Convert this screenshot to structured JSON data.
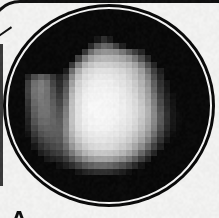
{
  "figure": {
    "panel_label": "A"
  },
  "colors": {
    "background": "#f5f5f4",
    "frame_line": "#0e0e0e",
    "disk_fill": "#070707",
    "ring": "#f7f7f7",
    "label": "#0d0d0d"
  },
  "bitmap": {
    "cols": 27,
    "rows": 23,
    "pixels": [
      [
        0,
        0,
        0,
        0,
        0,
        0,
        0,
        0,
        0,
        0,
        0,
        0,
        0,
        0,
        0,
        0,
        0,
        0,
        0,
        0,
        0,
        0,
        0,
        0,
        0,
        0,
        0
      ],
      [
        0,
        0,
        0,
        0,
        0,
        0,
        0,
        0,
        0,
        0,
        0,
        20,
        45,
        25,
        0,
        0,
        0,
        0,
        0,
        0,
        0,
        0,
        0,
        0,
        0,
        0,
        0
      ],
      [
        0,
        0,
        0,
        0,
        0,
        0,
        0,
        0,
        0,
        0,
        40,
        85,
        105,
        95,
        65,
        30,
        0,
        0,
        0,
        0,
        0,
        0,
        0,
        0,
        0,
        0,
        0
      ],
      [
        0,
        0,
        0,
        0,
        0,
        0,
        0,
        0,
        0,
        55,
        110,
        140,
        150,
        148,
        140,
        120,
        90,
        60,
        35,
        0,
        0,
        0,
        0,
        0,
        0,
        0,
        0
      ],
      [
        0,
        0,
        0,
        0,
        0,
        0,
        0,
        0,
        65,
        130,
        165,
        180,
        185,
        183,
        178,
        168,
        150,
        120,
        80,
        40,
        0,
        0,
        0,
        0,
        0,
        0,
        0
      ],
      [
        0,
        0,
        0,
        0,
        0,
        0,
        0,
        55,
        130,
        180,
        200,
        210,
        212,
        210,
        205,
        197,
        185,
        165,
        130,
        80,
        38,
        0,
        0,
        0,
        0,
        0,
        0
      ],
      [
        0,
        0,
        0,
        0,
        0,
        0,
        28,
        110,
        175,
        210,
        222,
        228,
        229,
        227,
        222,
        214,
        203,
        187,
        160,
        115,
        62,
        28,
        0,
        0,
        0,
        0,
        0
      ],
      [
        35,
        75,
        95,
        85,
        55,
        30,
        58,
        142,
        198,
        222,
        232,
        236,
        237,
        235,
        230,
        223,
        212,
        196,
        172,
        135,
        80,
        38,
        0,
        0,
        0,
        0,
        0
      ],
      [
        60,
        110,
        125,
        110,
        70,
        40,
        78,
        162,
        212,
        232,
        240,
        243,
        243,
        241,
        237,
        230,
        220,
        204,
        180,
        148,
        95,
        48,
        20,
        0,
        0,
        0,
        0
      ],
      [
        65,
        115,
        128,
        115,
        80,
        48,
        92,
        176,
        220,
        238,
        244,
        247,
        247,
        245,
        241,
        235,
        226,
        211,
        188,
        156,
        105,
        55,
        24,
        0,
        0,
        0,
        0
      ],
      [
        60,
        112,
        124,
        114,
        86,
        58,
        102,
        186,
        226,
        241,
        247,
        249,
        249,
        247,
        244,
        238,
        230,
        217,
        196,
        165,
        118,
        65,
        30,
        12,
        0,
        0,
        0
      ],
      [
        52,
        105,
        120,
        115,
        92,
        68,
        114,
        193,
        229,
        244,
        249,
        250,
        250,
        249,
        246,
        241,
        233,
        221,
        202,
        172,
        128,
        75,
        36,
        16,
        0,
        0,
        0
      ],
      [
        45,
        98,
        116,
        115,
        98,
        78,
        124,
        197,
        231,
        245,
        250,
        251,
        251,
        250,
        247,
        242,
        235,
        224,
        206,
        178,
        136,
        84,
        42,
        20,
        0,
        0,
        0
      ],
      [
        40,
        92,
        112,
        113,
        100,
        86,
        131,
        198,
        231,
        245,
        249,
        251,
        251,
        249,
        246,
        241,
        234,
        223,
        206,
        179,
        140,
        90,
        46,
        22,
        10,
        0,
        0
      ],
      [
        34,
        83,
        105,
        108,
        100,
        91,
        136,
        196,
        229,
        243,
        248,
        249,
        249,
        247,
        244,
        239,
        231,
        219,
        201,
        174,
        136,
        88,
        45,
        22,
        10,
        0,
        0
      ],
      [
        26,
        70,
        94,
        100,
        98,
        94,
        138,
        192,
        224,
        238,
        244,
        246,
        246,
        244,
        240,
        234,
        226,
        213,
        194,
        166,
        128,
        80,
        40,
        18,
        8,
        0,
        0
      ],
      [
        16,
        55,
        80,
        90,
        92,
        92,
        135,
        184,
        215,
        230,
        237,
        240,
        240,
        238,
        233,
        227,
        217,
        203,
        182,
        152,
        112,
        66,
        30,
        12,
        0,
        0,
        0
      ],
      [
        0,
        38,
        62,
        76,
        83,
        87,
        124,
        170,
        202,
        220,
        229,
        233,
        233,
        231,
        226,
        218,
        207,
        190,
        166,
        132,
        90,
        48,
        18,
        0,
        0,
        0,
        0
      ],
      [
        0,
        22,
        45,
        60,
        70,
        78,
        108,
        150,
        184,
        205,
        216,
        221,
        222,
        220,
        214,
        205,
        191,
        170,
        142,
        105,
        64,
        30,
        0,
        0,
        0,
        0,
        0
      ],
      [
        0,
        0,
        28,
        42,
        52,
        60,
        86,
        122,
        155,
        180,
        194,
        201,
        203,
        200,
        193,
        182,
        165,
        140,
        105,
        68,
        36,
        0,
        0,
        0,
        0,
        0,
        0
      ],
      [
        0,
        0,
        0,
        22,
        30,
        38,
        58,
        85,
        115,
        140,
        156,
        164,
        166,
        162,
        153,
        140,
        120,
        94,
        62,
        34,
        0,
        0,
        0,
        0,
        0,
        0,
        0
      ],
      [
        0,
        0,
        0,
        0,
        0,
        16,
        28,
        45,
        65,
        85,
        98,
        105,
        106,
        102,
        93,
        80,
        62,
        40,
        20,
        0,
        0,
        0,
        0,
        0,
        0,
        0,
        0
      ],
      [
        0,
        0,
        0,
        0,
        0,
        0,
        0,
        0,
        22,
        32,
        40,
        45,
        46,
        43,
        36,
        26,
        16,
        0,
        0,
        0,
        0,
        0,
        0,
        0,
        0,
        0,
        0
      ]
    ]
  }
}
